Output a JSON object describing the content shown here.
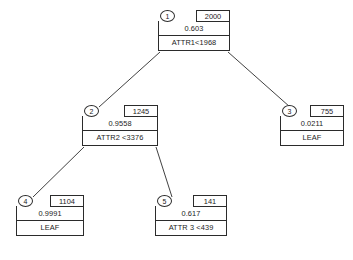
{
  "diagram": {
    "type": "decision-tree",
    "background_color": "#ffffff",
    "line_color": "#2b2b2b",
    "text_color": "#1b1b1b"
  },
  "nodes": [
    {
      "id": "1",
      "count": "2000",
      "probability": "0.603",
      "label": "ATTR1<1968",
      "is_leaf": false,
      "x": 158,
      "y": 10,
      "width": 72
    },
    {
      "id": "2",
      "count": "1245",
      "probability": "0.9558",
      "label": "ATTR2 <3376",
      "is_leaf": false,
      "x": 82,
      "y": 105,
      "width": 76
    },
    {
      "id": "3",
      "count": "755",
      "probability": "0.0211",
      "label": "LEAF",
      "is_leaf": true,
      "x": 280,
      "y": 105,
      "width": 64
    },
    {
      "id": "4",
      "count": "1104",
      "probability": "0.9991",
      "label": "LEAF",
      "is_leaf": true,
      "x": 16,
      "y": 195,
      "width": 68
    },
    {
      "id": "5",
      "count": "141",
      "probability": "0.617",
      "label": "ATTR 3 <439",
      "is_leaf": false,
      "x": 155,
      "y": 195,
      "width": 72
    }
  ],
  "edges": [
    {
      "from": "1",
      "to": "2",
      "x1": 160,
      "y1": 52,
      "x2": 99,
      "y2": 107
    },
    {
      "from": "1",
      "to": "3",
      "x1": 228,
      "y1": 52,
      "x2": 290,
      "y2": 107
    },
    {
      "from": "2",
      "to": "4",
      "x1": 84,
      "y1": 147,
      "x2": 33,
      "y2": 197
    },
    {
      "from": "2",
      "to": "5",
      "x1": 156,
      "y1": 147,
      "x2": 172,
      "y2": 197
    }
  ]
}
